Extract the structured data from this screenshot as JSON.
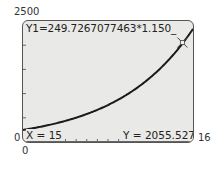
{
  "window": {
    "ymax_label": "2500",
    "ymin_label": "0",
    "xmin_label": "0",
    "xmax_label": "16"
  },
  "equation": "Y1=249.7267077463*1.150_",
  "trace": {
    "x_label": "X = 15",
    "y_label": "Y = 2055.527"
  },
  "colors": {
    "screen_bg": "#e9e9e7",
    "curve": "#1a1a1a",
    "border": "#555555"
  },
  "chart_data": {
    "type": "line",
    "xlabel": "X",
    "ylabel": "Y",
    "xlim": [
      0,
      16
    ],
    "ylim": [
      0,
      2500
    ],
    "grid": false,
    "series": [
      {
        "name": "Y1",
        "x": [
          0,
          2,
          4,
          6,
          8,
          10,
          12,
          14,
          15,
          16
        ],
        "values": [
          249.7,
          330.3,
          436.8,
          577.6,
          763.9,
          1010.3,
          1336.1,
          1767.0,
          2055.5,
          2363.8
        ]
      }
    ],
    "annotations": [
      {
        "type": "trace-cursor",
        "x": 15,
        "y": 2055.527
      }
    ]
  }
}
